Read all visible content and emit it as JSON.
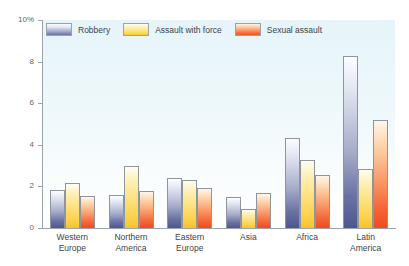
{
  "edge_caption": "",
  "axis": {
    "y_top_label": "10%",
    "ticks": [
      "10%",
      "8",
      "6",
      "4",
      "2",
      "0"
    ]
  },
  "legend": {
    "items": [
      {
        "label": "Robbery",
        "color": "#5a5f96"
      },
      {
        "label": "Assault with force",
        "color": "#fbd14b"
      },
      {
        "label": "Sexual assault",
        "color": "#f04e23"
      }
    ]
  },
  "chart_data": {
    "type": "bar",
    "title": "",
    "subtitle": "",
    "xlabel": "",
    "ylabel": "",
    "ylim": [
      0,
      10
    ],
    "yticks": [
      0,
      2,
      4,
      6,
      8,
      10
    ],
    "ytick_labels": [
      "0",
      "2",
      "4",
      "6",
      "8",
      "10%"
    ],
    "grid": false,
    "legend_position": "top-left",
    "units": "percent",
    "categories": [
      "Western Europe",
      "Northern America",
      "Eastern Europe",
      "Asia",
      "Africa",
      "Latin America"
    ],
    "category_lines": [
      [
        "Western",
        "Europe"
      ],
      [
        "Northern",
        "America"
      ],
      [
        "Eastern",
        "Europe"
      ],
      [
        "Asia",
        ""
      ],
      [
        "Africa",
        ""
      ],
      [
        "Latin",
        "America"
      ]
    ],
    "series": [
      {
        "name": "Robbery",
        "color": "#5a5f96",
        "values": [
          1.85,
          1.6,
          2.4,
          1.5,
          4.35,
          8.25
        ]
      },
      {
        "name": "Assault with force",
        "color": "#fbd14b",
        "values": [
          2.15,
          3.0,
          2.3,
          0.9,
          3.25,
          2.85
        ]
      },
      {
        "name": "Sexual assault",
        "color": "#f04e23",
        "values": [
          1.55,
          1.8,
          1.9,
          1.7,
          2.55,
          5.2
        ]
      }
    ]
  }
}
